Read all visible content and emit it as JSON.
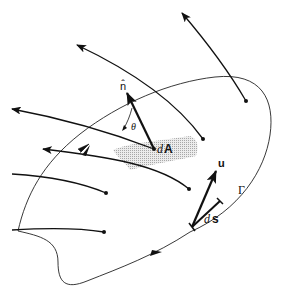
{
  "diagram": {
    "labels": {
      "normal": "n̂",
      "angle": "θ",
      "area_d": "d",
      "area_A": "A",
      "velocity": "u",
      "ds_d": "d",
      "ds_s": "s",
      "curve": "Γ"
    },
    "colors": {
      "stroke": "#111111",
      "patch": "#c8c8c8",
      "background": "#ffffff"
    }
  }
}
